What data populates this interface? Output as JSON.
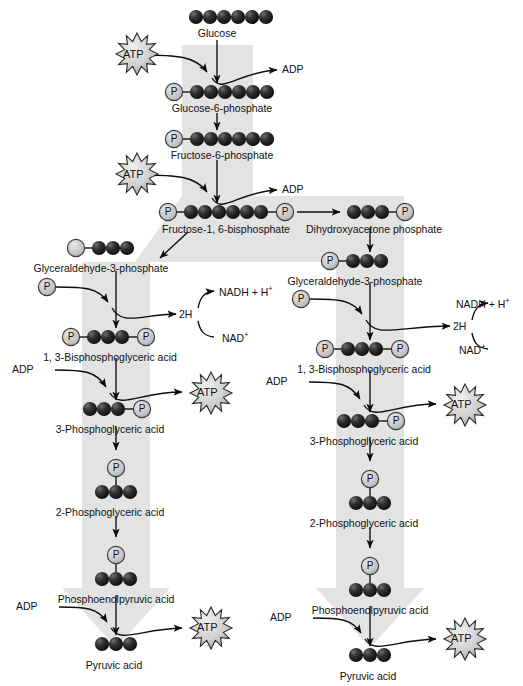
{
  "figure": {
    "type": "diagram",
    "colors": {
      "background": "#ffffff",
      "pathway_arrow_gray": "#e2e2e2",
      "carbon_sphere_dark": "#1d1d1d",
      "phosphate_circle_fill": "#c9c9c9",
      "phosphate_circle_stroke": "#3a3a3a",
      "atp_burst_fill": "#d2d2d2",
      "atp_burst_stroke": "#2b2b2b",
      "line_stroke": "#101010",
      "text": "#111111"
    }
  },
  "labels": {
    "glucose": "Glucose",
    "glucose_6_phosphate": "Glucose-6-phosphate",
    "fructose_6_phosphate": "Fructose-6-phosphate",
    "fructose_1_6_bisphosphate": "Fructose-1, 6-bisphosphate",
    "dihydroxyacetone_phosphate": "Dihydroxyacetone phosphate",
    "glyceraldehyde_3_phosphate": "Glyceraldehyde-3-phosphate",
    "bisphosphoglyceric_acid": "1, 3-Bisphosphoglyceric acid",
    "phosphoglyceric_acid_3": "3-Phosphoglyceric acid",
    "phosphoglyceric_acid_2": "2-Phosphoglyceric acid",
    "phosphoenolpyruvic_acid": "Phosphoenolpyruvic acid",
    "pyruvic_acid": "Pyruvic acid"
  },
  "molecules": {
    "atp": "ATP",
    "adp": "ADP",
    "phosphate": "P",
    "two_h": "2H",
    "nadh_plus_h": "NADH + H",
    "nadh_superscript": "+",
    "nad": "NAD",
    "nad_superscript": "+"
  },
  "pathway": {
    "left_branch": [
      {
        "name": "Glyceraldehyde-3-phosphate",
        "carbons": 3,
        "phosphates_left": 1,
        "phosphates_right": 0
      },
      {
        "name": "1, 3-Bisphosphoglyceric acid",
        "carbons": 3,
        "phosphates_left": 1,
        "phosphates_right": 1
      },
      {
        "name": "3-Phosphoglyceric acid",
        "carbons": 3,
        "phosphates_left": 0,
        "phosphates_right": 1
      },
      {
        "name": "2-Phosphoglyceric acid",
        "carbons": 3,
        "phosphates_left": 0,
        "phosphates_right": 0,
        "phosphate_above": true
      },
      {
        "name": "Phosphoenolpyruvic acid",
        "carbons": 3,
        "phosphates_left": 0,
        "phosphates_right": 0,
        "phosphate_above": true
      },
      {
        "name": "Pyruvic acid",
        "carbons": 3,
        "phosphates_left": 0,
        "phosphates_right": 0
      }
    ],
    "right_branch": [
      {
        "name": "Dihydroxyacetone phosphate",
        "carbons": 3,
        "phosphates_left": 0,
        "phosphates_right": 1
      },
      {
        "name": "Glyceraldehyde-3-phosphate",
        "carbons": 3,
        "phosphates_left": 1,
        "phosphates_right": 0
      },
      {
        "name": "1, 3-Bisphosphoglyceric acid",
        "carbons": 3,
        "phosphates_left": 1,
        "phosphates_right": 1
      },
      {
        "name": "3-Phosphoglyceric acid",
        "carbons": 3,
        "phosphates_left": 0,
        "phosphates_right": 1
      },
      {
        "name": "2-Phosphoglyceric acid",
        "carbons": 3,
        "phosphates_left": 0,
        "phosphates_right": 0,
        "phosphate_above": true
      },
      {
        "name": "Phosphoenolpyruvic acid",
        "carbons": 3,
        "phosphates_left": 0,
        "phosphates_right": 0,
        "phosphate_above": true
      },
      {
        "name": "Pyruvic acid",
        "carbons": 3,
        "phosphates_left": 0,
        "phosphates_right": 0
      }
    ],
    "trunk": [
      {
        "name": "Glucose",
        "carbons": 6,
        "phosphates_left": 0,
        "phosphates_right": 0
      },
      {
        "name": "Glucose-6-phosphate",
        "carbons": 6,
        "phosphates_left": 1,
        "phosphates_right": 0
      },
      {
        "name": "Fructose-6-phosphate",
        "carbons": 6,
        "phosphates_left": 1,
        "phosphates_right": 0
      },
      {
        "name": "Fructose-1, 6-bisphosphate",
        "carbons": 6,
        "phosphates_left": 1,
        "phosphates_right": 1
      }
    ],
    "energy_inputs": [
      "ATP",
      "ATP",
      "ADP",
      "ADP",
      "ADP",
      "ADP"
    ],
    "energy_outputs": [
      "ADP",
      "ADP",
      "ATP",
      "ATP",
      "ATP",
      "ATP"
    ],
    "redox": [
      "NADH + H+",
      "NAD+",
      "2H"
    ]
  }
}
